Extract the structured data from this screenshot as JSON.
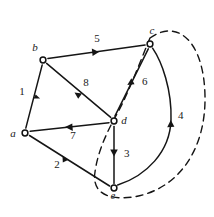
{
  "figure": {
    "kind": "directed-graph-with-cut",
    "width": 214,
    "height": 217,
    "background": "#ffffff",
    "ink_color": "#151515"
  },
  "nodes": [
    {
      "id": "a",
      "label": "a",
      "x": 25,
      "y": 133,
      "label_x": 13,
      "label_y": 137
    },
    {
      "id": "b",
      "label": "b",
      "x": 43,
      "y": 60,
      "label_x": 35,
      "label_y": 51
    },
    {
      "id": "c",
      "label": "c",
      "x": 150,
      "y": 44,
      "label_x": 152,
      "label_y": 34
    },
    {
      "id": "d",
      "label": "d",
      "x": 114,
      "y": 121,
      "label_x": 122,
      "label_y": 122
    },
    {
      "id": "e",
      "label": "e",
      "x": 114,
      "y": 188,
      "label_x": 112,
      "label_y": 198
    }
  ],
  "edges": [
    {
      "id": "e1",
      "label": "1",
      "from": "a",
      "to": "b",
      "label_x": 22,
      "label_y": 95,
      "arrow_at": 0.55,
      "shape": "straight"
    },
    {
      "id": "e2",
      "label": "2",
      "from": "a",
      "to": "e",
      "label_x": 57,
      "label_y": 168,
      "arrow_at": 0.48,
      "shape": "straight"
    },
    {
      "id": "e3",
      "label": "3",
      "from": "d",
      "to": "e",
      "label_x": 124,
      "label_y": 157,
      "arrow_at": 0.55,
      "shape": "straight"
    },
    {
      "id": "e4",
      "label": "4",
      "from": "e",
      "to": "c",
      "label_x": 178,
      "label_y": 119,
      "arrow_at": 0.6,
      "shape": "curve-right"
    },
    {
      "id": "e5",
      "label": "5",
      "from": "b",
      "to": "c",
      "label_x": 97,
      "label_y": 42,
      "arrow_at": 0.5,
      "shape": "straight"
    },
    {
      "id": "e6",
      "label": "6",
      "from": "d",
      "to": "c",
      "label_x": 142,
      "label_y": 85,
      "arrow_at": 0.55,
      "shape": "straight"
    },
    {
      "id": "e7",
      "label": "7",
      "from": "d",
      "to": "a",
      "label_x": 73,
      "label_y": 139,
      "arrow_at": 0.5,
      "shape": "straight"
    },
    {
      "id": "e8",
      "label": "8",
      "from": "b",
      "to": "d",
      "label_x": 86,
      "label_y": 86,
      "arrow_at": 0.5,
      "shape": "straight"
    }
  ],
  "cut": {
    "name": "dashed-cut-curve",
    "style": "dashed",
    "path": "M 150 38 C 178 18 204 42 205 96 C 206 150 178 190 133 197 C 104 201 92 190 95 172 C 98 150 108 130 118 112 C 128 94 140 62 150 38 Z"
  }
}
